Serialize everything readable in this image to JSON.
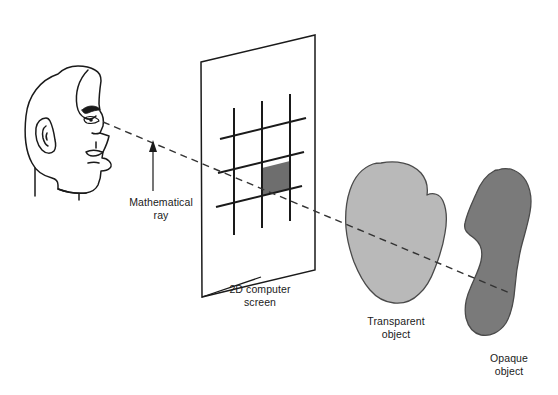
{
  "figure": {
    "width": 558,
    "height": 395,
    "background": "#ffffff"
  },
  "labels": {
    "mathematical_ray": "Mathematical\nray",
    "screen": "2D computer\nscreen",
    "transparent_object": "Transparent\nobject",
    "opaque_object": "Opaque\nobject"
  },
  "colors": {
    "outline": "#1a1a1a",
    "text": "#1a1a1a",
    "pixel_fill": "#6e6e6e",
    "transparent_object_fill": "#b9b9b9",
    "opaque_object_fill": "#7a7a7a",
    "ray": "#333333",
    "screen_frame": "#1a1a1a",
    "background": "#ffffff"
  },
  "elements": {
    "viewer_head": "head-profile-facing-right",
    "ray_origin": "eye",
    "screen_grid": {
      "vertical_lines": 3,
      "slanted_lines": 3,
      "shaded_pixel_count": 1
    },
    "arrow": "up-arrow-pointing-to-ray"
  },
  "icon_names": {
    "head": "head-profile-icon",
    "eye": "eye-icon",
    "ear": "ear-icon",
    "arrow": "arrow-up-icon",
    "ray": "dashed-ray-icon",
    "screen": "screen-plane-icon",
    "pixel": "shaded-pixel-icon"
  }
}
